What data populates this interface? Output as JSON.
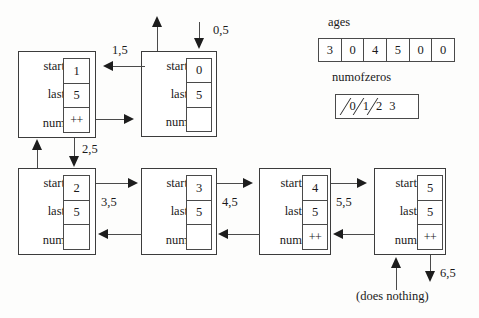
{
  "diagram": {
    "field_labels": {
      "start": "start",
      "last": "last",
      "num": "num"
    },
    "frames": [
      {
        "id": "frame-1",
        "start": "1",
        "last": "5",
        "num": "++"
      },
      {
        "id": "frame-0",
        "start": "0",
        "last": "5",
        "num": ""
      },
      {
        "id": "frame-2",
        "start": "2",
        "last": "5",
        "num": ""
      },
      {
        "id": "frame-3",
        "start": "3",
        "last": "5",
        "num": ""
      },
      {
        "id": "frame-4",
        "start": "4",
        "last": "5",
        "num": "++"
      },
      {
        "id": "frame-5",
        "start": "5",
        "last": "5",
        "num": "++"
      }
    ],
    "call_labels": {
      "entry": "0,5",
      "ret_to_1": "1,5",
      "call_2": "2,5",
      "call_3": "3,5",
      "call_4": "4,5",
      "call_5": "5,5",
      "call_6": "6,5"
    },
    "caption": "(does nothing)"
  },
  "arrays": {
    "ages": {
      "name": "ages",
      "values": [
        "3",
        "0",
        "4",
        "5",
        "0",
        "0"
      ]
    },
    "numofzeros": {
      "name": "numofzeros",
      "values": [
        "0",
        "1",
        "2",
        "3"
      ],
      "crossed_out": [
        true,
        true,
        true,
        false
      ]
    }
  },
  "colors": {
    "ink": "#1a1a1a",
    "stroke": "#4a4a4a",
    "arrowhead": "#1d1d1d",
    "paper": "#fdfdfc"
  }
}
